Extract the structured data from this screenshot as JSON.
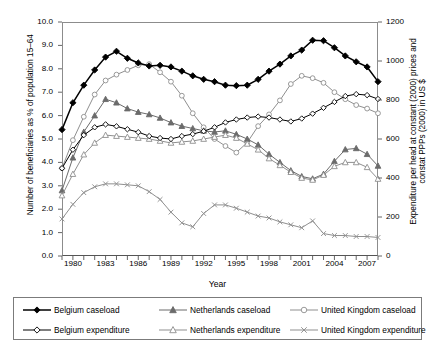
{
  "chart_data": {
    "type": "line",
    "title": "",
    "xlabel": "Year",
    "ylabel": "Number of beneficiaries as % of population 15–64",
    "ylabel_right": "Expenditure per head at constant (2000) prices and constat PPPs (2000) in US $",
    "ylim": [
      0.0,
      10.0
    ],
    "ylim_right": [
      0,
      1200
    ],
    "yticks": [
      "0.0",
      "1.0",
      "2.0",
      "3.0",
      "4.0",
      "5.0",
      "6.0",
      "7.0",
      "8.0",
      "9.0",
      "10.0"
    ],
    "yticks_right": [
      "0",
      "200",
      "400",
      "600",
      "800",
      "1000",
      "1200"
    ],
    "xlim": [
      1979,
      2008
    ],
    "x": [
      1979,
      1980,
      1981,
      1982,
      1983,
      1984,
      1985,
      1986,
      1987,
      1988,
      1989,
      1990,
      1991,
      1992,
      1993,
      1994,
      1995,
      1996,
      1997,
      1998,
      1999,
      2000,
      2001,
      2002,
      2003,
      2004,
      2005,
      2006,
      2007,
      2008
    ],
    "xtick_labels": [
      "1980",
      "1983",
      "1986",
      "1989",
      "1992",
      "1995",
      "1998",
      "2001",
      "2004",
      "2007"
    ],
    "xtick_values": [
      1980,
      1983,
      1986,
      1989,
      1992,
      1995,
      1998,
      2001,
      2004,
      2007
    ],
    "grid": false,
    "legend_position": "below",
    "series": [
      {
        "name": "Belgium caseload",
        "axis": "left",
        "marker": "filled-diamond",
        "color": "#000000",
        "values": [
          5.4,
          6.55,
          7.3,
          7.95,
          8.5,
          8.75,
          8.45,
          8.25,
          8.12,
          8.15,
          8.08,
          7.9,
          7.7,
          7.55,
          7.45,
          7.3,
          7.28,
          7.3,
          7.55,
          7.9,
          8.2,
          8.55,
          8.8,
          9.22,
          9.2,
          8.9,
          8.55,
          8.3,
          8.08,
          7.45
        ]
      },
      {
        "name": "Belgium expenditure",
        "axis": "right",
        "marker": "open-diamond",
        "color": "#000000",
        "values": [
          450,
          545,
          620,
          660,
          675,
          665,
          650,
          635,
          615,
          605,
          600,
          615,
          625,
          640,
          660,
          685,
          700,
          710,
          715,
          710,
          700,
          690,
          705,
          730,
          760,
          790,
          820,
          830,
          825,
          805
        ]
      },
      {
        "name": "Netherlands caseload",
        "axis": "left",
        "marker": "filled-triangle",
        "color": "#6b6b6b",
        "values": [
          2.8,
          4.2,
          5.3,
          6.0,
          6.7,
          6.55,
          6.3,
          6.15,
          6.05,
          5.9,
          5.7,
          5.55,
          5.45,
          5.35,
          5.3,
          5.35,
          5.2,
          5.0,
          4.75,
          4.35,
          4.0,
          3.65,
          3.4,
          3.3,
          3.5,
          4.05,
          4.55,
          4.6,
          4.35,
          3.85
        ]
      },
      {
        "name": "Netherlands expenditure",
        "axis": "right",
        "marker": "open-triangle",
        "color": "#8f8f8f",
        "values": [
          310,
          420,
          520,
          580,
          620,
          615,
          610,
          605,
          600,
          590,
          580,
          585,
          590,
          600,
          610,
          620,
          605,
          575,
          545,
          500,
          465,
          430,
          400,
          390,
          415,
          460,
          480,
          480,
          455,
          395
        ]
      },
      {
        "name": "United Kingdom caseload",
        "axis": "left",
        "marker": "open-circle",
        "color": "#8f8f8f",
        "values": [
          3.75,
          4.95,
          5.95,
          6.9,
          7.5,
          7.75,
          7.95,
          8.15,
          8.2,
          7.85,
          7.45,
          6.85,
          6.1,
          5.5,
          5.0,
          4.7,
          4.42,
          4.85,
          5.55,
          6.05,
          6.65,
          7.35,
          7.7,
          7.6,
          7.4,
          7.0,
          6.7,
          6.45,
          6.3,
          6.1
        ]
      },
      {
        "name": "United Kingdom expenditure",
        "axis": "right",
        "marker": "x",
        "color": "#8f8f8f",
        "values": [
          190,
          265,
          325,
          355,
          370,
          370,
          365,
          360,
          330,
          290,
          225,
          170,
          150,
          218,
          262,
          262,
          245,
          225,
          205,
          195,
          175,
          160,
          145,
          180,
          115,
          105,
          105,
          100,
          100,
          95
        ]
      }
    ]
  },
  "legend": {
    "items": [
      {
        "label": "Belgium caseload",
        "icon": "filled-diamond-marker"
      },
      {
        "label": "Netherlands caseload",
        "icon": "filled-triangle-marker"
      },
      {
        "label": "United Kingdom caseload",
        "icon": "open-circle-marker"
      },
      {
        "label": "Belgium expenditure",
        "icon": "open-diamond-marker"
      },
      {
        "label": "Netherlands expenditure",
        "icon": "open-triangle-marker"
      },
      {
        "label": "United Kingdom expenditure",
        "icon": "x-marker"
      }
    ]
  }
}
